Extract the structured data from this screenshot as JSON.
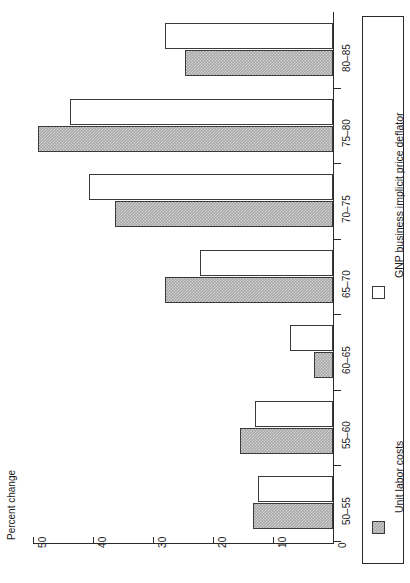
{
  "chart_data": {
    "type": "bar",
    "orientation": "horizontal-rotated",
    "title": "",
    "xlabel": "Percent change",
    "ylabel": "",
    "categories": [
      "50–55",
      "55–60",
      "60–65",
      "65–70",
      "70–75",
      "75–80",
      "80–85"
    ],
    "series": [
      {
        "name": "Unit labor costs",
        "values": [
          13.3,
          15.5,
          3.2,
          28.0,
          36.3,
          49.2,
          24.7
        ],
        "swatch": "gray"
      },
      {
        "name": "GNP business implicit price deflator",
        "values": [
          12.5,
          13.0,
          7.2,
          22.2,
          40.7,
          43.8,
          28.0
        ],
        "swatch": "white"
      }
    ],
    "axis": {
      "ticks": [
        50,
        40,
        30,
        20,
        10,
        0
      ],
      "tick_labels": [
        "50",
        "40",
        "30",
        "20",
        "10",
        "0"
      ],
      "min": 0,
      "max": 50,
      "grid": false
    },
    "legend": {
      "position": "right",
      "entries": [
        {
          "label": "Unit labor costs",
          "swatch": "gray"
        },
        {
          "label": "GNP business implicit price deflator",
          "swatch": "white"
        }
      ]
    },
    "colors": {
      "bar_gray": "#a8a8a8",
      "bar_white": "#ffffff",
      "outline": "#3a3a3a",
      "axis": "#2a2a2a",
      "text": "#1a1a1a",
      "background": "#ffffff"
    }
  }
}
